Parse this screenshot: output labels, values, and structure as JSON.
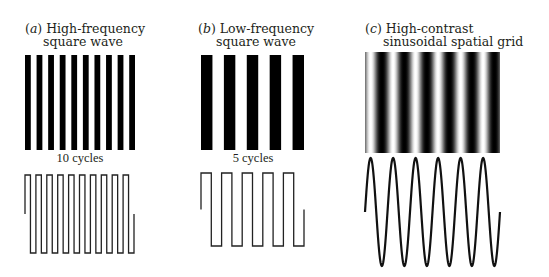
{
  "panels": [
    {
      "id": "a",
      "letter": "a",
      "title_line1": "High-frequency",
      "title_line2": "square wave",
      "cycles_label": "10 cycles",
      "pattern": "square-bars",
      "cycles": 10
    },
    {
      "id": "b",
      "letter": "b",
      "title_line1": "Low-frequency",
      "title_line2": "square wave",
      "cycles_label": "5 cycles",
      "pattern": "square-bars",
      "cycles": 5
    },
    {
      "id": "c",
      "letter": "c",
      "title_line1": "High-contrast",
      "title_line2": "sinusoidal spatial grid",
      "cycles_label": "",
      "pattern": "sinusoidal-grating",
      "cycles": 6
    }
  ],
  "colors": {
    "ink": "#000000",
    "text": "#231f20",
    "background": "#ffffff",
    "waveform_stroke": "#222222"
  },
  "chart_data": [
    {
      "type": "line",
      "title": "(a) High-frequency square wave",
      "waveform": "square",
      "cycles": 10,
      "annotation": "10 cycles",
      "luminance_profile": "alternating black/white bars, 10 black bars"
    },
    {
      "type": "line",
      "title": "(b) Low-frequency square wave",
      "waveform": "square",
      "cycles": 5,
      "annotation": "5 cycles",
      "luminance_profile": "alternating black/white bars, 5 black bars"
    },
    {
      "type": "line",
      "title": "(c) High-contrast sinusoidal spatial grid",
      "waveform": "sine",
      "cycles": 6,
      "annotation": "",
      "luminance_profile": "smooth sinusoidal black-to-white gradient, 6 cycles"
    }
  ]
}
